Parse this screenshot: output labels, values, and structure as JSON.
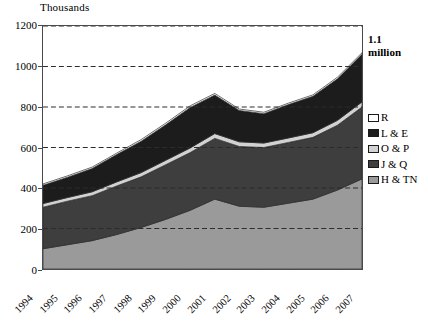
{
  "axis": {
    "unit_label": "Thousands",
    "y_ticks": [
      0,
      200,
      400,
      600,
      800,
      1000,
      1200
    ],
    "x_labels": [
      "1994",
      "1995",
      "1996",
      "1997",
      "1998",
      "1999",
      "2000",
      "2001",
      "2002",
      "2003",
      "2004",
      "2005",
      "2006",
      "2007"
    ]
  },
  "annotation": {
    "line1": "1.1",
    "line2": "million"
  },
  "legend": {
    "items": [
      {
        "label": "R",
        "color": "#ffffff"
      },
      {
        "label": "L & E",
        "color": "#1c1c1c"
      },
      {
        "label": "O & P",
        "color": "#d2d2d2"
      },
      {
        "label": "J & Q",
        "color": "#3e3e3e"
      },
      {
        "label": "H & TN",
        "color": "#9a9a9a"
      }
    ]
  },
  "chart_data": {
    "type": "area",
    "title": "",
    "subtitle": "",
    "xlabel": "",
    "ylabel": "Thousands",
    "ylim": [
      0,
      1200
    ],
    "ytick_step": 200,
    "grid": "horizontal-dashed",
    "legend_position": "right",
    "stacked": true,
    "stack_order_bottom_to_top": [
      "H & TN",
      "J & Q",
      "O & P",
      "L & E",
      "R"
    ],
    "categories": [
      "1994",
      "1995",
      "1996",
      "1997",
      "1998",
      "1999",
      "2000",
      "2001",
      "2002",
      "2003",
      "2004",
      "2005",
      "2006",
      "2007"
    ],
    "series": [
      {
        "name": "H & TN",
        "color": "#9a9a9a",
        "values": [
          100,
          120,
          140,
          170,
          205,
          245,
          290,
          345,
          310,
          305,
          325,
          345,
          390,
          445
        ]
      },
      {
        "name": "J & Q",
        "color": "#3e3e3e",
        "values": [
          205,
          215,
          222,
          240,
          250,
          270,
          285,
          300,
          295,
          295,
          300,
          305,
          320,
          355
        ]
      },
      {
        "name": "O & P",
        "color": "#d2d2d2",
        "values": [
          18,
          18,
          19,
          20,
          21,
          22,
          23,
          24,
          23,
          22,
          22,
          23,
          24,
          25
        ]
      },
      {
        "name": "L & E",
        "color": "#1c1c1c",
        "values": [
          90,
          100,
          115,
          135,
          155,
          175,
          200,
          190,
          155,
          145,
          165,
          180,
          205,
          235
        ]
      },
      {
        "name": "R",
        "color": "#ffffff",
        "values": [
          7,
          7,
          7,
          7,
          8,
          8,
          8,
          8,
          7,
          7,
          7,
          7,
          8,
          8
        ]
      }
    ],
    "cumulative_totals": [
      420,
      460,
      503,
      572,
      639,
      720,
      806,
      867,
      790,
      774,
      819,
      860,
      947,
      1068
    ],
    "annotations": [
      {
        "text": "1.1 million",
        "at_category": "2007",
        "position": "right-of-plot-top"
      }
    ]
  }
}
